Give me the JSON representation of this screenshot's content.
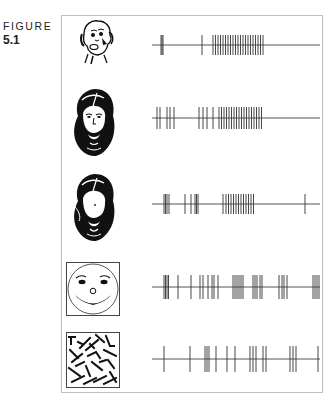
{
  "figure": {
    "label_word": "FIGURE",
    "label_number": "5.1"
  },
  "chart_data": {
    "type": "raster",
    "title": "",
    "xlabel": "",
    "ylabel": "",
    "note": "Spike positions are approximate x-pixel estimates read from the screenshot; dense bursts are rendered as evenly spaced ticks over the burst extent.",
    "rows": [
      {
        "stimulus": "monkey-face",
        "line": {
          "x1": 152,
          "x2": 320,
          "y": 45
        },
        "spike_half_height": 10,
        "spikes": [
          161,
          162,
          163,
          202,
          213,
          215.5,
          218,
          220.5,
          223,
          225.5,
          228,
          230.5,
          233,
          235.5,
          238,
          240.5,
          243,
          245.5,
          248,
          250.5,
          253,
          255.5,
          258,
          260.5,
          263
        ]
      },
      {
        "stimulus": "bearded-man-face",
        "line": {
          "x1": 152,
          "x2": 320,
          "y": 118
        },
        "spike_half_height": 11,
        "spikes": [
          157,
          160,
          167,
          170,
          174,
          199,
          203,
          207,
          213,
          219,
          221.5,
          224,
          226.5,
          229,
          231.5,
          234,
          236.5,
          239,
          241.5,
          244,
          246.5,
          249,
          251.5,
          254,
          256.5,
          259,
          261.5
        ]
      },
      {
        "stimulus": "face-without-eyes",
        "line": {
          "x1": 152,
          "x2": 320,
          "y": 204
        },
        "spike_half_height": 10,
        "spikes": [
          164,
          165.5,
          167,
          169,
          185,
          191,
          195,
          196.5,
          198,
          223,
          226,
          228.5,
          231,
          233.5,
          236,
          238.5,
          241,
          243.5,
          246,
          248.5,
          251,
          253.5,
          305
        ]
      },
      {
        "stimulus": "smiley-cartoon",
        "line": {
          "x1": 152,
          "x2": 320,
          "y": 287
        },
        "spike_half_height": 12,
        "spikes": [
          164,
          165.5,
          167,
          168.5,
          178,
          191,
          200,
          203,
          208,
          212,
          214,
          218,
          233,
          235,
          237,
          239,
          241,
          243,
          253,
          255,
          257,
          260,
          262,
          279,
          282,
          284,
          287,
          313,
          315,
          317,
          319
        ]
      },
      {
        "stimulus": "scrambled-lines",
        "line": {
          "x1": 152,
          "x2": 320,
          "y": 359
        },
        "spike_half_height": 13,
        "spikes": [
          164,
          190,
          205,
          207,
          209,
          216,
          227,
          235,
          250,
          253,
          256,
          263,
          266,
          290,
          293,
          296,
          318
        ]
      }
    ]
  }
}
